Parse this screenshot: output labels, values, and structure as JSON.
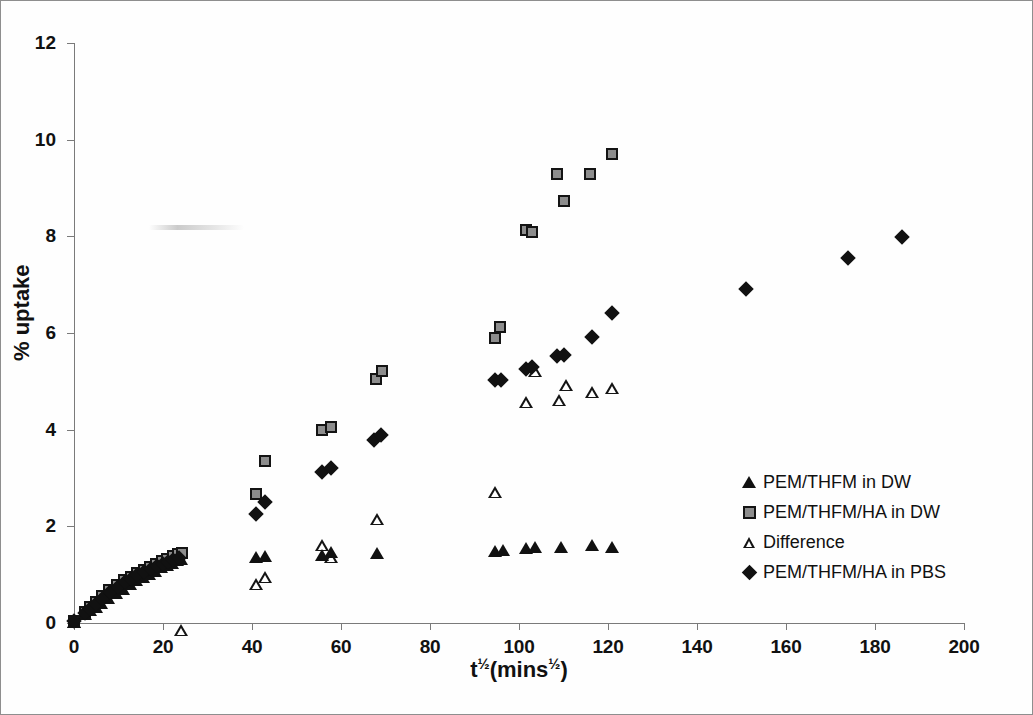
{
  "figure": {
    "border_color": "#8e8e8e",
    "background": "#ffffff"
  },
  "axes": {
    "y_title": "% uptake",
    "x_title_base": "t",
    "x_title_mid": "(mins",
    "x_title_end": ")",
    "x_exponent": "½",
    "y_exponent": "½",
    "x_ticks": [
      0,
      20,
      40,
      60,
      80,
      100,
      120,
      140,
      160,
      180,
      200
    ],
    "y_ticks": [
      0,
      2,
      4,
      6,
      8,
      10,
      12
    ]
  },
  "legend": {
    "items": [
      {
        "label": "PEM/THFM in DW",
        "marker": "filled-triangle",
        "color": "#111111"
      },
      {
        "label": "PEM/THFM/HA in DW",
        "marker": "gray-square",
        "color": "#8d8d8d"
      },
      {
        "label": "Difference",
        "marker": "open-triangle",
        "color": "#ffffff"
      },
      {
        "label": "PEM/THFM/HA in PBS",
        "marker": "filled-diamond",
        "color": "#111111"
      }
    ]
  },
  "chart_data": {
    "type": "scatter",
    "title": "",
    "xlabel": "t½(mins½)",
    "ylabel": "% uptake",
    "xlim": [
      0,
      200
    ],
    "ylim": [
      0,
      12
    ],
    "xtick_step": 20,
    "ytick_step": 2,
    "grid": false,
    "legend_position": "inside-right",
    "series": [
      {
        "name": "PEM/THFM in DW",
        "marker": "filled-triangle",
        "color": "#111111",
        "points": [
          [
            0.0,
            0.03
          ],
          [
            2.4,
            0.18
          ],
          [
            3.5,
            0.26
          ],
          [
            4.9,
            0.34
          ],
          [
            6.0,
            0.42
          ],
          [
            7.7,
            0.52
          ],
          [
            9.5,
            0.62
          ],
          [
            11.0,
            0.7
          ],
          [
            12.6,
            0.8
          ],
          [
            13.9,
            0.88
          ],
          [
            15.5,
            0.95
          ],
          [
            16.9,
            1.02
          ],
          [
            18.3,
            1.08
          ],
          [
            19.6,
            1.15
          ],
          [
            20.8,
            1.2
          ],
          [
            22.0,
            1.25
          ],
          [
            23.2,
            1.3
          ],
          [
            24.0,
            1.33
          ],
          [
            40.8,
            1.36
          ],
          [
            43.0,
            1.38
          ],
          [
            55.8,
            1.4
          ],
          [
            57.8,
            1.46
          ],
          [
            68.2,
            1.45
          ],
          [
            94.5,
            1.5
          ],
          [
            96.5,
            1.52
          ],
          [
            101.5,
            1.55
          ],
          [
            103.5,
            1.57
          ],
          [
            109.5,
            1.57
          ],
          [
            116.5,
            1.62
          ],
          [
            121.0,
            1.58
          ]
        ]
      },
      {
        "name": "PEM/THFM/HA in DW",
        "marker": "gray-square",
        "color": "#8d8d8d",
        "points": [
          [
            0.0,
            0.05
          ],
          [
            2.4,
            0.22
          ],
          [
            3.6,
            0.33
          ],
          [
            5.0,
            0.44
          ],
          [
            6.2,
            0.55
          ],
          [
            7.9,
            0.68
          ],
          [
            9.6,
            0.78
          ],
          [
            11.2,
            0.88
          ],
          [
            12.8,
            0.96
          ],
          [
            14.1,
            1.03
          ],
          [
            15.7,
            1.1
          ],
          [
            17.1,
            1.16
          ],
          [
            18.5,
            1.22
          ],
          [
            19.8,
            1.28
          ],
          [
            21.0,
            1.33
          ],
          [
            22.2,
            1.38
          ],
          [
            23.4,
            1.42
          ],
          [
            24.2,
            1.45
          ],
          [
            40.8,
            2.66
          ],
          [
            43.0,
            3.35
          ],
          [
            55.8,
            4.0
          ],
          [
            57.8,
            4.05
          ],
          [
            67.8,
            5.05
          ],
          [
            69.2,
            5.22
          ],
          [
            94.5,
            5.9
          ],
          [
            95.8,
            6.12
          ],
          [
            101.5,
            8.13
          ],
          [
            103.0,
            8.08
          ],
          [
            108.5,
            9.28
          ],
          [
            110.0,
            8.73
          ],
          [
            116.0,
            9.3
          ],
          [
            121.0,
            9.7
          ]
        ]
      },
      {
        "name": "Difference",
        "marker": "open-triangle",
        "color": "#ffffff",
        "points": [
          [
            0.0,
            0.02
          ],
          [
            24.0,
            0.1
          ],
          [
            40.8,
            1.3
          ],
          [
            43.0,
            1.7
          ],
          [
            55.8,
            2.6
          ],
          [
            57.8,
            2.6
          ],
          [
            68.2,
            3.65
          ],
          [
            94.5,
            4.45
          ],
          [
            101.5,
            6.55
          ],
          [
            103.5,
            7.45
          ],
          [
            109.0,
            7.1
          ],
          [
            110.5,
            7.65
          ],
          [
            116.5,
            7.75
          ],
          [
            121.0,
            8.08
          ]
        ]
      },
      {
        "name": "PEM/THFM/HA in PBS",
        "marker": "filled-diamond",
        "color": "#111111",
        "points": [
          [
            0.0,
            0.04
          ],
          [
            2.4,
            0.2
          ],
          [
            3.6,
            0.3
          ],
          [
            5.0,
            0.4
          ],
          [
            6.2,
            0.5
          ],
          [
            8.0,
            0.64
          ],
          [
            9.8,
            0.75
          ],
          [
            11.4,
            0.84
          ],
          [
            12.9,
            0.92
          ],
          [
            14.2,
            0.99
          ],
          [
            15.8,
            1.05
          ],
          [
            17.2,
            1.11
          ],
          [
            18.6,
            1.17
          ],
          [
            19.9,
            1.22
          ],
          [
            21.1,
            1.27
          ],
          [
            22.3,
            1.31
          ],
          [
            23.5,
            1.35
          ],
          [
            40.8,
            2.25
          ],
          [
            43.0,
            2.5
          ],
          [
            55.8,
            3.12
          ],
          [
            57.8,
            3.2
          ],
          [
            67.5,
            3.78
          ],
          [
            69.0,
            3.88
          ],
          [
            94.5,
            5.02
          ],
          [
            96.0,
            5.03
          ],
          [
            101.5,
            5.25
          ],
          [
            103.0,
            5.3
          ],
          [
            108.5,
            5.52
          ],
          [
            110.0,
            5.55
          ],
          [
            116.5,
            5.92
          ],
          [
            121.0,
            6.42
          ],
          [
            151.0,
            6.92
          ],
          [
            174.0,
            7.55
          ],
          [
            186.0,
            7.98
          ]
        ]
      }
    ]
  }
}
